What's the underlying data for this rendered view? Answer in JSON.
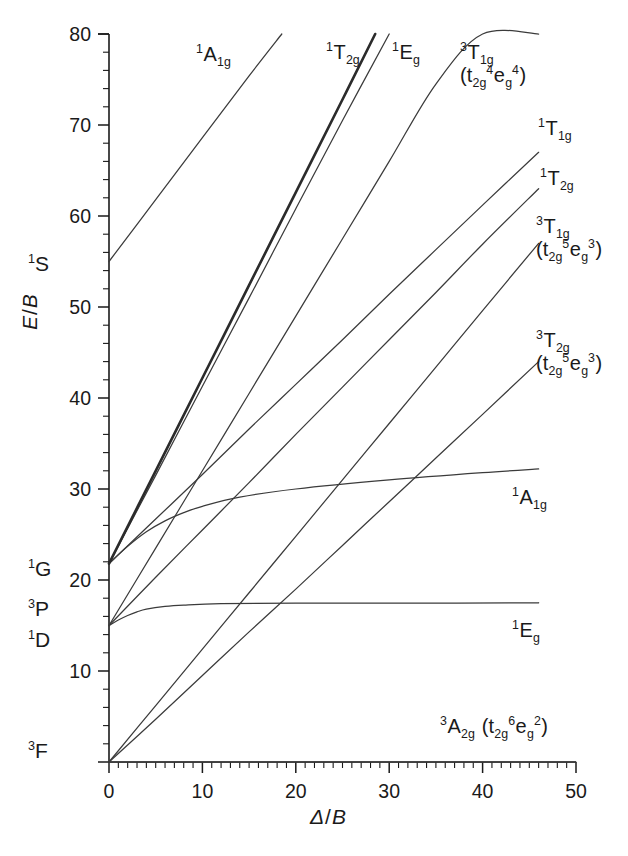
{
  "figure": {
    "kind": "tanabe-sugano-diagram",
    "configuration": "d8"
  },
  "axes": {
    "x": {
      "title_symbol": "Δ",
      "title_denominator": "B",
      "min": 0,
      "max": 50,
      "major_step": 10,
      "minor_step": 1,
      "tick_labels": [
        "0",
        "10",
        "20",
        "30",
        "40",
        "50"
      ],
      "tick_values": [
        0,
        10,
        20,
        30,
        40,
        50
      ]
    },
    "y": {
      "title_symbol": "E",
      "title_denominator": "B",
      "min": 0,
      "max": 80,
      "major_step": 10,
      "minor_step": 2,
      "tick_labels": [
        "10",
        "20",
        "30",
        "40",
        "50",
        "60",
        "70",
        "80"
      ],
      "tick_values": [
        10,
        20,
        30,
        40,
        50,
        60,
        70,
        80
      ]
    },
    "grid": false,
    "frame": "left-and-bottom-only"
  },
  "free_ion_terms": [
    {
      "name": "free-ion-term-1S",
      "multiplicity": "1",
      "letter": "S",
      "energy": 55.0,
      "label_y_px": 265
    },
    {
      "name": "free-ion-term-1G",
      "multiplicity": "1",
      "letter": "G",
      "energy": 21.8,
      "label_y_px": 570
    },
    {
      "name": "free-ion-term-3P",
      "multiplicity": "3",
      "letter": "P",
      "energy": 17.5,
      "label_y_px": 610
    },
    {
      "name": "free-ion-term-1D",
      "multiplicity": "1",
      "letter": "D",
      "energy": 15.0,
      "label_y_px": 641
    },
    {
      "name": "free-ion-term-3F",
      "multiplicity": "3",
      "letter": "F",
      "energy": 0.0,
      "label_y_px": 752
    }
  ],
  "curve_labels": [
    {
      "name": "curve-label-1A1g-top",
      "multiplicity": "1",
      "symbol": "A",
      "sub": "1g",
      "config": null,
      "x_px": 196,
      "y_px": 44
    },
    {
      "name": "curve-label-1T2g-top",
      "multiplicity": "1",
      "symbol": "T",
      "sub": "2g",
      "config": null,
      "x_px": 326,
      "y_px": 42
    },
    {
      "name": "curve-label-1Eg-top",
      "multiplicity": "1",
      "symbol": "E",
      "sub": "g",
      "config": null,
      "x_px": 392,
      "y_px": 42
    },
    {
      "name": "curve-label-3T1g-upper",
      "multiplicity": "3",
      "symbol": "T",
      "sub": "1g",
      "config": {
        "t2g": "4",
        "eg": "4"
      },
      "x_px": 460,
      "y_px": 42
    },
    {
      "name": "curve-label-1T1g",
      "multiplicity": "1",
      "symbol": "T",
      "sub": "1g",
      "config": null,
      "x_px": 538,
      "y_px": 118
    },
    {
      "name": "curve-label-1T2g",
      "multiplicity": "1",
      "symbol": "T",
      "sub": "2g",
      "config": null,
      "x_px": 540,
      "y_px": 168
    },
    {
      "name": "curve-label-3T1g-lower",
      "multiplicity": "3",
      "symbol": "T",
      "sub": "1g",
      "config": {
        "t2g": "5",
        "eg": "3"
      },
      "x_px": 536,
      "y_px": 216
    },
    {
      "name": "curve-label-3T2g",
      "multiplicity": "3",
      "symbol": "T",
      "sub": "2g",
      "config": {
        "t2g": "5",
        "eg": "3"
      },
      "x_px": 536,
      "y_px": 330
    },
    {
      "name": "curve-label-1A1g-flat",
      "multiplicity": "1",
      "symbol": "A",
      "sub": "1g",
      "config": null,
      "x_px": 512,
      "y_px": 487
    },
    {
      "name": "curve-label-1Eg-flat",
      "multiplicity": "1",
      "symbol": "E",
      "sub": "g",
      "config": null,
      "x_px": 512,
      "y_px": 620
    },
    {
      "name": "curve-label-3A2g-ground",
      "multiplicity": "3",
      "symbol": "A",
      "sub": "2g",
      "config": {
        "t2g": "6",
        "eg": "2"
      },
      "x_px": 440,
      "y_px": 716
    }
  ],
  "chart_data": {
    "type": "line",
    "title": "",
    "xlabel": "Δ / B",
    "ylabel": "E / B",
    "xlim": [
      0,
      50
    ],
    "ylim": [
      0,
      80
    ],
    "grid": false,
    "legend": "inline-curve-labels",
    "series": [
      {
        "name": "3A2g (t2g^6 eg^2)",
        "style": "thin",
        "origin_term": "3F",
        "x": [
          0,
          50
        ],
        "y": [
          0,
          0
        ]
      },
      {
        "name": "3T2g (t2g^5 eg^3)",
        "style": "thin",
        "origin_term": "3F",
        "x": [
          0,
          5,
          10,
          15,
          20,
          25,
          30,
          35,
          40,
          46
        ],
        "y": [
          0,
          4.7,
          9.5,
          14.3,
          19.0,
          23.8,
          28.6,
          33.4,
          38.2,
          44.0
        ]
      },
      {
        "name": "3T1g (t2g^5 eg^3)",
        "style": "thin",
        "origin_term": "3F",
        "x": [
          0,
          5,
          10,
          15,
          20,
          25,
          30,
          35,
          40,
          46
        ],
        "y": [
          0,
          6.2,
          12.4,
          18.6,
          24.8,
          31.0,
          37.2,
          43.4,
          49.6,
          57.0
        ]
      },
      {
        "name": "3T1g (t2g^4 eg^4) upper",
        "style": "thin",
        "origin_term": "3P",
        "x": [
          0,
          5,
          10,
          15,
          20,
          25,
          30,
          35,
          40,
          46
        ],
        "y": [
          15.0,
          23.5,
          32.0,
          40.5,
          49.0,
          57.5,
          66.0,
          74.5,
          80.0,
          80.0
        ]
      },
      {
        "name": "1Eg (flat, from 1D)",
        "style": "thin",
        "origin_term": "1D",
        "x": [
          0,
          1,
          2,
          3,
          4,
          6,
          8,
          12,
          20,
          30,
          46
        ],
        "y": [
          15.0,
          15.6,
          16.1,
          16.5,
          16.8,
          17.1,
          17.25,
          17.4,
          17.45,
          17.45,
          17.5
        ]
      },
      {
        "name": "1T2g (from 1D)",
        "style": "thin",
        "origin_term": "1D",
        "x": [
          0,
          5,
          10,
          15,
          20,
          25,
          30,
          35,
          40,
          46
        ],
        "y": [
          15.0,
          20.3,
          25.5,
          30.7,
          36.0,
          41.2,
          46.4,
          51.6,
          56.9,
          63.0
        ]
      },
      {
        "name": "1A1g (flat, from 1G)",
        "style": "thin",
        "origin_term": "1G",
        "x": [
          0,
          2,
          4,
          6,
          8,
          10,
          14,
          20,
          30,
          40,
          46
        ],
        "y": [
          21.8,
          23.7,
          25.3,
          26.5,
          27.4,
          28.1,
          29.1,
          30.0,
          31.0,
          31.8,
          32.2
        ]
      },
      {
        "name": "1T1g (from 1G)",
        "style": "thin",
        "origin_term": "1G",
        "x": [
          0,
          5,
          10,
          15,
          20,
          25,
          30,
          35,
          40,
          46
        ],
        "y": [
          21.8,
          26.7,
          31.6,
          36.6,
          41.5,
          46.4,
          51.4,
          56.3,
          61.2,
          67.0
        ]
      },
      {
        "name": "1Eg (steep, from 1G)",
        "style": "thin",
        "origin_term": "1G",
        "x": [
          0,
          5,
          10,
          15,
          20,
          25,
          30
        ],
        "y": [
          21.8,
          31.5,
          41.3,
          51.0,
          60.8,
          70.5,
          80.0
        ]
      },
      {
        "name": "1T2g (steep, from 1G)",
        "style": "bold",
        "origin_term": "1G",
        "x": [
          0,
          5,
          10,
          15,
          20,
          25,
          28.5
        ],
        "y": [
          21.8,
          32.0,
          42.2,
          52.4,
          62.6,
          72.8,
          80.0
        ]
      },
      {
        "name": "1A1g (from 1S)",
        "style": "thin",
        "origin_term": "1S",
        "x": [
          0,
          5,
          10,
          15,
          18.5
        ],
        "y": [
          55.0,
          61.8,
          68.6,
          75.4,
          80.0
        ]
      }
    ]
  }
}
